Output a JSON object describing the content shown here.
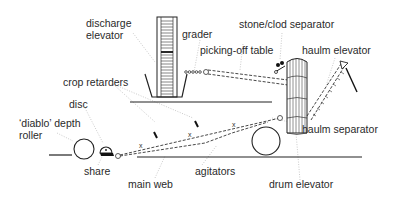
{
  "diagram": {
    "labels": {
      "discharge_elevator_1": "discharge",
      "discharge_elevator_2": "elevator",
      "grader": "grader",
      "stone_clod_separator": "stone/clod separator",
      "picking_off_table": "picking-off table",
      "haulm_elevator": "haulm elevator",
      "crop_retarders": "crop retarders",
      "disc": "disc",
      "diablo_roller_1": "‘diablo’ depth",
      "diablo_roller_2": "roller",
      "haulm_separator": "haulm separator",
      "share": "share",
      "agitators": "agitators",
      "main_web": "main web",
      "drum_elevator": "drum elevator"
    },
    "markers": {
      "agitator_mark": "x"
    },
    "colors": {
      "line": "#222222",
      "leader": "#b5b5b5",
      "text": "#2a2a2a",
      "background": "#ffffff"
    }
  }
}
